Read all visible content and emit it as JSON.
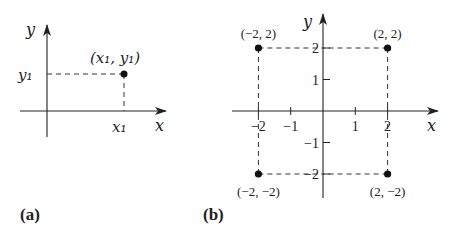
{
  "panel_a": {
    "label": "(a)",
    "x_axis_label": "x",
    "y_axis_label": "y",
    "point_label": "(x₁, y₁)",
    "x_tick_label": "x₁",
    "y_tick_label": "y₁"
  },
  "panel_b": {
    "label": "(b)",
    "x_axis_label": "x",
    "y_axis_label": "y",
    "x_ticks": [
      {
        "value": -2,
        "label": "−2"
      },
      {
        "value": -1,
        "label": "−1"
      },
      {
        "value": 1,
        "label": "1"
      },
      {
        "value": 2,
        "label": "2"
      }
    ],
    "y_ticks": [
      {
        "value": 2,
        "label": "2"
      },
      {
        "value": 1,
        "label": "1"
      },
      {
        "value": -1,
        "label": "−1"
      },
      {
        "value": -2,
        "label": "−2"
      }
    ],
    "points": [
      {
        "x": -2,
        "y": 2,
        "label": "(−2, 2)"
      },
      {
        "x": 2,
        "y": 2,
        "label": "(2, 2)"
      },
      {
        "x": -2,
        "y": -2,
        "label": "(−2, −2)"
      },
      {
        "x": 2,
        "y": -2,
        "label": "(2, −2)"
      }
    ]
  }
}
